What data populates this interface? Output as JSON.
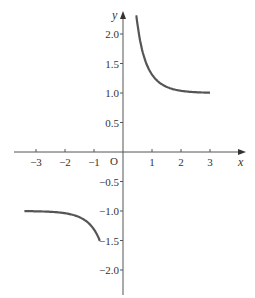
{
  "chart_data": {
    "type": "line",
    "title": "",
    "xlabel": "x",
    "ylabel": "y",
    "origin_label": "O",
    "xlim": [
      -3.5,
      3.6
    ],
    "ylim": [
      -2.3,
      2.3
    ],
    "grid": false,
    "x_ticks": [
      {
        "value": -3,
        "label": "−3"
      },
      {
        "value": -2,
        "label": "−2"
      },
      {
        "value": -1,
        "label": "−1"
      },
      {
        "value": 1,
        "label": "1"
      },
      {
        "value": 2,
        "label": "2"
      },
      {
        "value": 3,
        "label": "3"
      }
    ],
    "y_ticks": [
      {
        "value": 2.0,
        "label": "2.0"
      },
      {
        "value": 1.5,
        "label": "1.5"
      },
      {
        "value": 1.0,
        "label": "1.0"
      },
      {
        "value": 0.5,
        "label": "0.5"
      },
      {
        "value": -0.5,
        "label": "−0.5"
      },
      {
        "value": -1.0,
        "label": "−1.0"
      },
      {
        "value": -1.5,
        "label": "−1.5"
      },
      {
        "value": -2.0,
        "label": "−2.0"
      }
    ],
    "series": [
      {
        "name": "upper-branch",
        "color": "#555555",
        "x": [
          0.43,
          0.5,
          0.6,
          0.75,
          1.0,
          1.25,
          1.5,
          2.0,
          2.5,
          3.0
        ],
        "y": [
          2.3,
          2.16,
          1.86,
          1.57,
          1.31,
          1.18,
          1.1,
          1.04,
          1.01,
          1.0
        ]
      },
      {
        "name": "lower-branch",
        "color": "#555555",
        "x": [
          -3.4,
          -3.0,
          -2.5,
          -2.0,
          -1.5,
          -1.25,
          -1.0,
          -0.9,
          -0.8
        ],
        "y": [
          -1.0,
          -1.0,
          -1.01,
          -1.04,
          -1.1,
          -1.18,
          -1.31,
          -1.4,
          -2.3
        ]
      }
    ]
  }
}
